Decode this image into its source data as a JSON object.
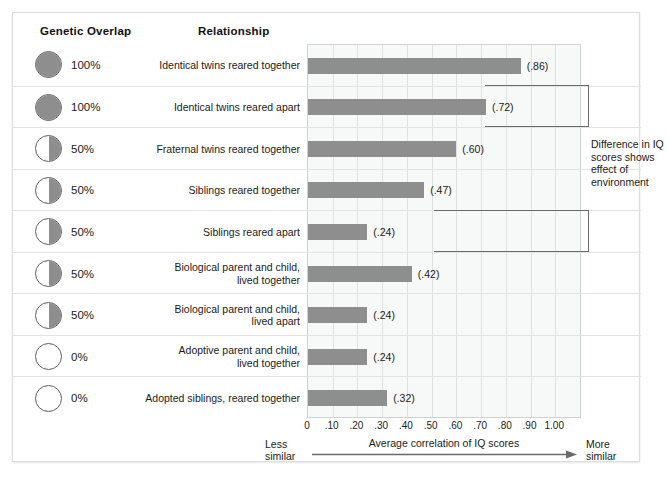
{
  "headers": {
    "genetic_overlap": "Genetic Overlap",
    "relationship": "Relationship"
  },
  "annotation": {
    "text": "Difference in IQ scores shows effect of environment"
  },
  "axis": {
    "title": "Average correlation of IQ scores",
    "less_similar": "Less\nsimilar",
    "more_similar": "More\nsimilar",
    "ticks": [
      "0",
      ".10",
      ".20",
      ".30",
      ".40",
      ".50",
      ".60",
      ".70",
      ".80",
      ".90",
      "1.00"
    ]
  },
  "colors": {
    "bar": "#8e8e8e",
    "circle_fill": "#8e8e8e",
    "plot_background": "#f7f8f8",
    "gridline": "#dfe2e2",
    "row_separator": "#e3e3e3"
  },
  "chart_data": {
    "type": "bar",
    "orientation": "horizontal",
    "title": "",
    "xlabel": "Average correlation of IQ scores",
    "ylabel": "",
    "xlim": [
      0,
      1.1
    ],
    "grid": true,
    "legend": "none",
    "categories": [
      "Identical twins reared together",
      "Identical twins reared apart",
      "Fraternal twins reared together",
      "Siblings reared together",
      "Siblings reared apart",
      "Biological parent and child, lived together",
      "Biological parent and child, lived apart",
      "Adoptive parent and child, lived together",
      "Adopted siblings, reared together"
    ],
    "values": [
      0.86,
      0.72,
      0.6,
      0.47,
      0.24,
      0.42,
      0.24,
      0.24,
      0.32
    ],
    "value_labels": [
      "(.86)",
      "(.72)",
      "(.60)",
      "(.47)",
      "(.24)",
      "(.42)",
      "(.24)",
      "(.24)",
      "(.32)"
    ],
    "genetic_overlap": [
      "100%",
      "100%",
      "50%",
      "50%",
      "50%",
      "50%",
      "50%",
      "0%",
      "0%"
    ]
  },
  "rows": [
    {
      "overlap": "100%",
      "circle": "full",
      "label_lines": [
        "Identical twins reared together"
      ],
      "value": 0.86,
      "value_label": "(.86)"
    },
    {
      "overlap": "100%",
      "circle": "full",
      "label_lines": [
        "Identical twins reared apart"
      ],
      "value": 0.72,
      "value_label": "(.72)"
    },
    {
      "overlap": "50%",
      "circle": "half",
      "label_lines": [
        "Fraternal twins reared together"
      ],
      "value": 0.6,
      "value_label": "(.60)"
    },
    {
      "overlap": "50%",
      "circle": "half",
      "label_lines": [
        "Siblings reared together"
      ],
      "value": 0.47,
      "value_label": "(.47)"
    },
    {
      "overlap": "50%",
      "circle": "half",
      "label_lines": [
        "Siblings reared apart"
      ],
      "value": 0.24,
      "value_label": "(.24)"
    },
    {
      "overlap": "50%",
      "circle": "half",
      "label_lines": [
        "Biological parent and child,",
        "lived together"
      ],
      "value": 0.42,
      "value_label": "(.42)"
    },
    {
      "overlap": "50%",
      "circle": "half",
      "label_lines": [
        "Biological parent and child,",
        "lived apart"
      ],
      "value": 0.24,
      "value_label": "(.24)"
    },
    {
      "overlap": "0%",
      "circle": "empty",
      "label_lines": [
        "Adoptive parent and child,",
        "lived together"
      ],
      "value": 0.24,
      "value_label": "(.24)"
    },
    {
      "overlap": "0%",
      "circle": "empty",
      "label_lines": [
        "Adopted siblings, reared together"
      ],
      "value": 0.32,
      "value_label": "(.32)"
    }
  ]
}
